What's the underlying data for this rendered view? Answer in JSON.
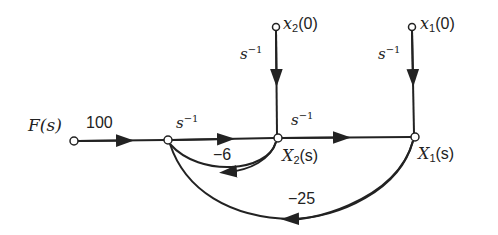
{
  "diagram": {
    "type": "signal-flow-graph",
    "nodes": [
      {
        "id": "F",
        "label": "F(s)"
      },
      {
        "id": "N1",
        "label": ""
      },
      {
        "id": "X2",
        "label_main": "X",
        "label_sub": "2",
        "label_tail": "(s)"
      },
      {
        "id": "X1",
        "label_main": "X",
        "label_sub": "1",
        "label_tail": "(s)"
      },
      {
        "id": "x20",
        "label_main": "x",
        "label_sub": "2",
        "label_tail": "(0)"
      },
      {
        "id": "x10",
        "label_main": "x",
        "label_sub": "1",
        "label_tail": "(0)"
      }
    ],
    "branches": [
      {
        "from": "F",
        "to": "N1",
        "gain": "100"
      },
      {
        "from": "N1",
        "to": "X2",
        "gain_base": "s",
        "gain_exp": "−1"
      },
      {
        "from": "X2",
        "to": "X1",
        "gain_base": "s",
        "gain_exp": "−1"
      },
      {
        "from": "x20",
        "to": "X2",
        "gain_base": "s",
        "gain_exp": "−1"
      },
      {
        "from": "x10",
        "to": "X1",
        "gain_base": "s",
        "gain_exp": "−1"
      },
      {
        "from": "X2",
        "to": "N1",
        "gain": "−6"
      },
      {
        "from": "X1",
        "to": "N1",
        "gain": "−25"
      }
    ]
  }
}
